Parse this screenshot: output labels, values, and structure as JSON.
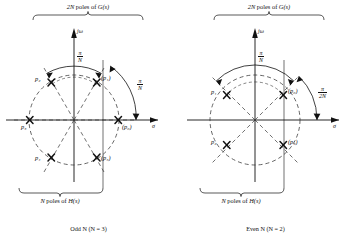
{
  "figure": {
    "panels": [
      {
        "id": "odd-n",
        "caption": "Odd N (N = 3)",
        "top_brace_label_prefix": "2N",
        "top_brace_label_rest": " poles of ",
        "top_brace_label_func": "G(s)",
        "bottom_brace_label_prefix": "N",
        "bottom_brace_label_rest": " poles of ",
        "bottom_brace_label_func": "H(s)",
        "axis_imag": "jω",
        "axis_real": "σ",
        "angles": [
          {
            "name": "arc-angle-top",
            "num": "π",
            "den": "N"
          },
          {
            "name": "arc-angle-right",
            "num": "π",
            "den": "N"
          }
        ],
        "poles": [
          {
            "label": "p₀",
            "paren": true,
            "angle_deg": 0,
            "name": "pole-p0"
          },
          {
            "label": "p₁",
            "paren": true,
            "angle_deg": 60,
            "name": "pole-p1"
          },
          {
            "label": "p₂",
            "paren": false,
            "angle_deg": 120,
            "name": "pole-p2"
          },
          {
            "label": "p₃",
            "paren": false,
            "angle_deg": 180,
            "name": "pole-p3"
          },
          {
            "label": "p₄",
            "paren": false,
            "angle_deg": 240,
            "name": "pole-p4"
          },
          {
            "label": "p₅",
            "paren": true,
            "angle_deg": 300,
            "name": "pole-p5"
          }
        ]
      },
      {
        "id": "even-n",
        "caption": "Even N (N = 2)",
        "top_brace_label_prefix": "2N",
        "top_brace_label_rest": " poles of ",
        "top_brace_label_func": "G(s)",
        "bottom_brace_label_prefix": "N",
        "bottom_brace_label_rest": " poles of ",
        "bottom_brace_label_func": "H(s)",
        "axis_imag": "jω",
        "axis_real": "σ",
        "angles": [
          {
            "name": "arc-angle-top",
            "num": "π",
            "den": "N"
          },
          {
            "name": "arc-angle-right",
            "num": "π",
            "den": "2N"
          }
        ],
        "poles": [
          {
            "label": "p₀",
            "paren": true,
            "angle_deg": 45,
            "name": "pole-p0"
          },
          {
            "label": "p₁",
            "paren": false,
            "angle_deg": 135,
            "name": "pole-p1"
          },
          {
            "label": "p₂",
            "paren": false,
            "angle_deg": 225,
            "name": "pole-p2"
          },
          {
            "label": "p₃",
            "paren": true,
            "angle_deg": 315,
            "name": "pole-p3"
          }
        ]
      }
    ],
    "colors": {
      "ink": "#111111",
      "dashed": "#333333",
      "background": "#ffffff"
    }
  }
}
